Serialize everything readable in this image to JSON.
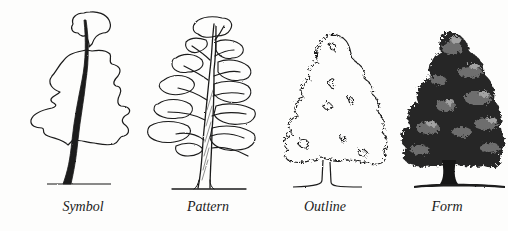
{
  "figure": {
    "panels": [
      {
        "id": "symbol",
        "label": "Symbol",
        "label_x": 83,
        "style": "single outline with solid dark trunk"
      },
      {
        "id": "pattern",
        "label": "Pattern",
        "label_x": 208,
        "style": "outlined foliage clumps with visible branching"
      },
      {
        "id": "outline",
        "label": "Outline",
        "label_x": 325,
        "style": "irregular jagged silhouette outline"
      },
      {
        "id": "form",
        "label": "Form",
        "label_x": 447,
        "style": "fully shaded tonal rendering"
      }
    ],
    "colors": {
      "background": "#fdfdfc",
      "ink": "#1a1a1a",
      "mid_tone": "#5a5a5a",
      "light_tone": "#9a9a9a"
    }
  }
}
